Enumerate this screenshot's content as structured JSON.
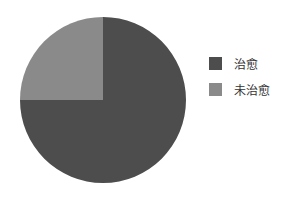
{
  "chart_data": {
    "type": "pie",
    "title": "",
    "labels": [
      "治愈",
      "未治愈"
    ],
    "values": [
      75,
      25
    ],
    "colors": [
      "#4d4d4d",
      "#8a8a8a"
    ],
    "start_angle_deg": -90,
    "direction": "clockwise",
    "legend_position": "right"
  },
  "legend": {
    "items": [
      {
        "label": "治愈",
        "color": "#4d4d4d"
      },
      {
        "label": "未治愈",
        "color": "#8a8a8a"
      }
    ]
  }
}
